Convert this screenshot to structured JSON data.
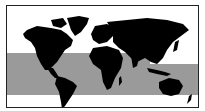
{
  "map": {
    "title": "",
    "projection": "world-equirectangular",
    "colors": {
      "land": "#000000",
      "ocean": "#ffffff",
      "highlight_band": "#9a9a9a",
      "frame": "#222222"
    },
    "highlight_band": {
      "description": "tropical zone band",
      "segments": [
        {
          "region": "west",
          "lat_top": 30,
          "lat_bottom": -35
        },
        {
          "region": "east",
          "lat_top": 20,
          "lat_bottom": -35
        }
      ]
    },
    "regions": [
      "north-america",
      "greenland",
      "south-america",
      "europe",
      "africa",
      "asia",
      "australia",
      "new-zealand",
      "indonesia"
    ]
  }
}
